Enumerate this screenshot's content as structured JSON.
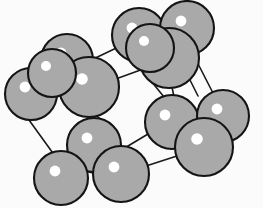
{
  "figure": {
    "background_color": "#fbfbfb",
    "width": 263,
    "height": 208
  },
  "style": {
    "atom_fill": "#a9a9a9",
    "atom_outline": "#141414",
    "highlight_color": "#ffffff",
    "bond_color": "#1a1a1a",
    "bond_width": 1.6,
    "atom_outline_width": 2.1
  },
  "chart_data": {
    "type": "scatter",
    "xlabel": "",
    "ylabel": "",
    "xlim": [
      0,
      263
    ],
    "ylim": [
      0,
      208
    ],
    "grid": false,
    "legend": "none",
    "atom_count": 14,
    "bond_count": 12,
    "atoms": [
      {
        "id": "a1",
        "label": "corner-back-top-left",
        "cx": 31,
        "cy": 94,
        "r": 26,
        "hx": 25,
        "hy": 87,
        "hr": 5.4
      },
      {
        "id": "a2",
        "label": "edge-top-left",
        "cx": 67,
        "cy": 60,
        "r": 26,
        "hx": 61,
        "hy": 53,
        "hr": 5.4
      },
      {
        "id": "a3",
        "label": "face-front-top-left",
        "cx": 89,
        "cy": 87,
        "r": 30,
        "hx": 82,
        "hy": 79,
        "hr": 5.8
      },
      {
        "id": "a4",
        "label": "corner-top-mid",
        "cx": 139,
        "cy": 35,
        "r": 27,
        "hx": 132,
        "hy": 28,
        "hr": 5.4
      },
      {
        "id": "a5",
        "label": "corner-top-right",
        "cx": 187,
        "cy": 28,
        "r": 27,
        "hx": 181,
        "hy": 21,
        "hr": 5.4
      },
      {
        "id": "a6",
        "label": "face-top-right",
        "cx": 169,
        "cy": 58,
        "r": 30,
        "hx": 162,
        "hy": 50,
        "hr": 5.8
      },
      {
        "id": "a7",
        "label": "center-right",
        "cx": 172,
        "cy": 122,
        "r": 27,
        "hx": 165,
        "hy": 115,
        "hr": 5.4
      },
      {
        "id": "a8",
        "label": "corner-mid-right",
        "cx": 223,
        "cy": 116,
        "r": 26,
        "hx": 217,
        "hy": 109,
        "hr": 5.4
      },
      {
        "id": "a9",
        "label": "face-front-right",
        "cx": 204,
        "cy": 147,
        "r": 29,
        "hx": 197,
        "hy": 139,
        "hr": 5.8
      },
      {
        "id": "a10",
        "label": "face-front-center",
        "cx": 94,
        "cy": 145,
        "r": 27,
        "hx": 87,
        "hy": 138,
        "hr": 5.4
      },
      {
        "id": "a11",
        "label": "corner-front-bottom",
        "cx": 121,
        "cy": 174,
        "r": 28,
        "hx": 114,
        "hy": 167,
        "hr": 5.4
      },
      {
        "id": "a12",
        "label": "corner-bottom-left",
        "cx": 61,
        "cy": 178,
        "r": 27,
        "hx": 55,
        "hy": 171,
        "hr": 5.4
      },
      {
        "id": "a13",
        "label": "edge-upper-left-back",
        "cx": 52,
        "cy": 73,
        "r": 24,
        "hx": 46,
        "hy": 66,
        "hr": 5.0
      },
      {
        "id": "a14",
        "label": "face-back-top",
        "cx": 150,
        "cy": 48,
        "r": 24,
        "hx": 144,
        "hy": 41,
        "hr": 5.0
      }
    ],
    "bonds": [
      {
        "id": "b1",
        "label": "top-back-edge",
        "x1": 87,
        "y1": 62,
        "x2": 131,
        "y2": 41
      },
      {
        "id": "b2",
        "label": "top-right-back-edge",
        "x1": 163,
        "y1": 34,
        "x2": 181,
        "y2": 31
      },
      {
        "id": "b3",
        "label": "top-front-edge",
        "x1": 113,
        "y1": 80,
        "x2": 146,
        "y2": 68
      },
      {
        "id": "b4",
        "label": "right-back-vertical",
        "x1": 193,
        "y1": 54,
        "x2": 214,
        "y2": 95
      },
      {
        "id": "b5",
        "label": "right-mid-vertical",
        "x1": 172,
        "y1": 87,
        "x2": 174,
        "y2": 97
      },
      {
        "id": "b6",
        "label": "left-back-vertical",
        "x1": 29,
        "y1": 120,
        "x2": 55,
        "y2": 156
      },
      {
        "id": "b7",
        "label": "left-front-vertical",
        "x1": 88,
        "y1": 117,
        "x2": 92,
        "y2": 120
      },
      {
        "id": "b8",
        "label": "left-front-vertical2",
        "x1": 97,
        "y1": 116,
        "x2": 101,
        "y2": 120
      },
      {
        "id": "b9",
        "label": "bottom-front-edge",
        "x1": 86,
        "y1": 171,
        "x2": 96,
        "y2": 174
      },
      {
        "id": "b10",
        "label": "bottom-right-edge",
        "x1": 146,
        "y1": 166,
        "x2": 180,
        "y2": 155
      },
      {
        "id": "b11",
        "label": "mid-front-edge",
        "x1": 118,
        "y1": 152,
        "x2": 148,
        "y2": 134
      },
      {
        "id": "b12",
        "label": "center-left-edge",
        "x1": 196,
        "y1": 130,
        "x2": 178,
        "y2": 137
      },
      {
        "id": "b13",
        "label": "top-mid-vertical",
        "x1": 147,
        "y1": 76,
        "x2": 164,
        "y2": 97
      },
      {
        "id": "b14",
        "label": "back-right-vertical",
        "x1": 186,
        "y1": 72,
        "x2": 198,
        "y2": 96
      }
    ]
  }
}
